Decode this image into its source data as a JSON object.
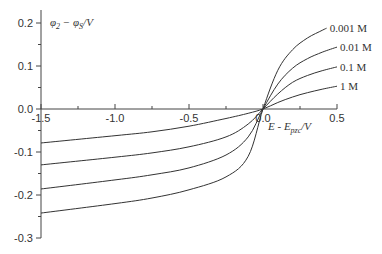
{
  "chart_data": {
    "type": "line",
    "title": "",
    "xlabel": "E - E_pzc/V",
    "ylabel": "φ2 − φS/V",
    "xlim": [
      -1.5,
      0.5
    ],
    "ylim": [
      -0.3,
      0.2
    ],
    "grid": false,
    "legend_position": "inline-right-end-of-lines",
    "x_ticks": [
      -1.5,
      -1.0,
      -0.5,
      0.0,
      0.5
    ],
    "x_tick_labels": [
      "-1.5",
      "-1.0",
      "-0.5",
      "0.0",
      "0.5"
    ],
    "y_ticks": [
      0.2,
      0.1,
      0.0,
      -0.1,
      -0.2,
      -0.3
    ],
    "y_tick_labels": [
      "0.2",
      "0.1",
      "0.0",
      "-0.1",
      "-0.2",
      "-0.3"
    ],
    "series": [
      {
        "name": "0.001 M",
        "x": [
          -1.5,
          -1.0,
          -0.75,
          -0.5,
          -0.25,
          -0.1,
          0.0,
          0.1,
          0.2,
          0.3,
          0.4,
          0.43
        ],
        "values": [
          -0.242,
          -0.22,
          -0.207,
          -0.188,
          -0.158,
          -0.11,
          0.0,
          0.09,
          0.138,
          0.165,
          0.183,
          0.188
        ]
      },
      {
        "name": "0.01 M",
        "x": [
          -1.5,
          -1.0,
          -0.75,
          -0.5,
          -0.25,
          -0.1,
          0.0,
          0.1,
          0.2,
          0.3,
          0.4,
          0.5
        ],
        "values": [
          -0.186,
          -0.165,
          -0.153,
          -0.137,
          -0.107,
          -0.065,
          0.0,
          0.058,
          0.095,
          0.117,
          0.132,
          0.144
        ]
      },
      {
        "name": "0.1 M",
        "x": [
          -1.5,
          -1.0,
          -0.75,
          -0.5,
          -0.25,
          -0.1,
          0.0,
          0.1,
          0.2,
          0.3,
          0.4,
          0.5
        ],
        "values": [
          -0.13,
          -0.112,
          -0.102,
          -0.088,
          -0.065,
          -0.035,
          0.0,
          0.035,
          0.062,
          0.078,
          0.089,
          0.098
        ]
      },
      {
        "name": "1 M",
        "x": [
          -1.5,
          -1.0,
          -0.75,
          -0.5,
          -0.25,
          -0.1,
          0.0,
          0.1,
          0.2,
          0.3,
          0.4,
          0.5
        ],
        "values": [
          -0.079,
          -0.062,
          -0.053,
          -0.04,
          -0.022,
          -0.01,
          0.0,
          0.015,
          0.028,
          0.038,
          0.046,
          0.053
        ]
      }
    ]
  },
  "labels": {
    "y_axis_main": "φ",
    "y_axis_sub1": "2",
    "y_axis_mid": " − φ",
    "y_axis_sub2": "S",
    "y_axis_unit": "/V",
    "x_axis_main": "E - E",
    "x_axis_sub": "pzc",
    "x_axis_unit": "/V"
  },
  "colors": {
    "line": "#333333",
    "axis": "#444444"
  }
}
